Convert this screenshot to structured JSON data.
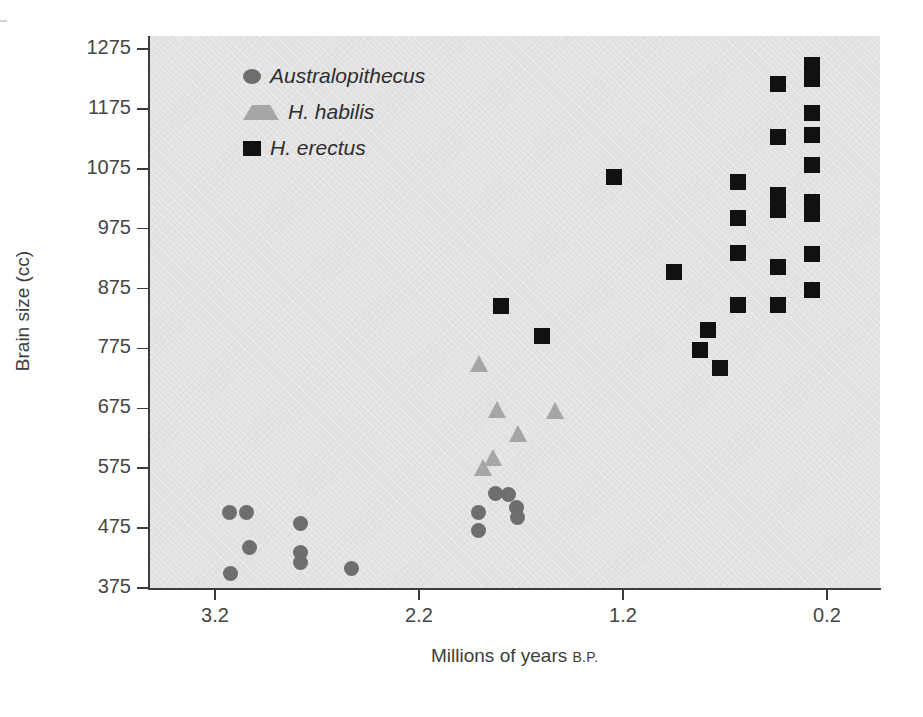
{
  "figure": {
    "background_color": "#ffffff",
    "plot_background_color": "#e2e2e2"
  },
  "axes": {
    "y_title": "Brain size (cc)",
    "x_title_main": "Millions of years ",
    "x_title_suffix": "B.P.",
    "y_ticks": [
      "375",
      "475",
      "575",
      "675",
      "775",
      "875",
      "975",
      "1075",
      "1175",
      "1275"
    ],
    "x_ticks": [
      "3.2",
      "2.2",
      "1.2",
      "0.2"
    ]
  },
  "legend": {
    "items": [
      {
        "label": "Australopithecus",
        "marker": "circle",
        "color": "#6e6e6e"
      },
      {
        "label": "H. habilis",
        "marker": "triangle",
        "color": "#a6a6a6"
      },
      {
        "label": "H. erectus",
        "marker": "square",
        "color": "#111111"
      }
    ]
  },
  "chart_data": {
    "type": "scatter",
    "title": "",
    "xlabel": "Millions of years B.P.",
    "ylabel": "Brain size (cc)",
    "xlim": [
      3.5,
      0.05
    ],
    "ylim": [
      375,
      1290
    ],
    "x_reversed": true,
    "grid": false,
    "legend_position": "upper-left-inside",
    "xticks": [
      3.2,
      2.2,
      1.2,
      0.2
    ],
    "yticks": [
      375,
      475,
      575,
      675,
      775,
      875,
      975,
      1075,
      1175,
      1275
    ],
    "series": [
      {
        "name": "Australopithecus",
        "marker": "circle",
        "color": "#6e6e6e",
        "points": [
          {
            "x": 3.13,
            "y": 498
          },
          {
            "x": 3.05,
            "y": 498
          },
          {
            "x": 3.04,
            "y": 440
          },
          {
            "x": 3.12,
            "y": 400
          },
          {
            "x": 2.79,
            "y": 483
          },
          {
            "x": 2.79,
            "y": 435
          },
          {
            "x": 2.79,
            "y": 418
          },
          {
            "x": 2.54,
            "y": 403
          },
          {
            "x": 1.75,
            "y": 472
          },
          {
            "x": 1.69,
            "y": 503
          },
          {
            "x": 1.63,
            "y": 502
          },
          {
            "x": 1.59,
            "y": 513
          },
          {
            "x": 1.58,
            "y": 496
          },
          {
            "x": 1.75,
            "y": 503
          }
        ]
      },
      {
        "name": "H. habilis",
        "marker": "triangle",
        "color": "#a6a6a6",
        "points": [
          {
            "x": 1.73,
            "y": 750
          },
          {
            "x": 1.64,
            "y": 672
          },
          {
            "x": 1.36,
            "y": 670
          },
          {
            "x": 1.55,
            "y": 631
          },
          {
            "x": 1.64,
            "y": 591
          },
          {
            "x": 1.7,
            "y": 580
          }
        ]
      },
      {
        "name": "H. erectus",
        "marker": "square",
        "color": "#111111",
        "points": [
          {
            "x": 1.62,
            "y": 847
          },
          {
            "x": 1.42,
            "y": 797
          },
          {
            "x": 1.18,
            "y": 1065
          },
          {
            "x": 0.57,
            "y": 902
          },
          {
            "x": 0.87,
            "y": 903
          },
          {
            "x": 0.83,
            "y": 812
          },
          {
            "x": 0.8,
            "y": 780
          },
          {
            "x": 0.7,
            "y": 750
          },
          {
            "x": 0.49,
            "y": 1057
          },
          {
            "x": 0.49,
            "y": 1022
          },
          {
            "x": 0.49,
            "y": 940
          },
          {
            "x": 0.49,
            "y": 848
          },
          {
            "x": 0.49,
            "y": 848
          },
          {
            "x": 0.49,
            "y": 1218
          },
          {
            "x": 0.49,
            "y": 1137
          },
          {
            "x": 0.32,
            "y": 1250
          },
          {
            "x": 0.32,
            "y": 1226
          },
          {
            "x": 0.32,
            "y": 1168
          },
          {
            "x": 0.32,
            "y": 1132
          },
          {
            "x": 0.32,
            "y": 1082
          },
          {
            "x": 0.32,
            "y": 1020
          },
          {
            "x": 0.32,
            "y": 1002
          },
          {
            "x": 0.32,
            "y": 873
          },
          {
            "x": 0.49,
            "y": 1012
          }
        ]
      }
    ]
  },
  "pixel_geometry": {
    "plot_left": 149,
    "plot_top": 36,
    "plot_width": 731,
    "plot_height": 552,
    "x_pix": {
      "3.2": 215,
      "2.2": 419,
      "1.2": 623,
      "0.2": 827
    },
    "y_pix": {
      "375": 588,
      "1275": 49
    }
  },
  "points_px": {
    "circles": [
      [
        229,
        512
      ],
      [
        246,
        512
      ],
      [
        249,
        547
      ],
      [
        230,
        573
      ],
      [
        300,
        523
      ],
      [
        300,
        552
      ],
      [
        300,
        562
      ],
      [
        351,
        568
      ],
      [
        478,
        530
      ],
      [
        495,
        493
      ],
      [
        508,
        494
      ],
      [
        516,
        507
      ],
      [
        517,
        517
      ],
      [
        478,
        512
      ]
    ],
    "triangles": [
      [
        479,
        364
      ],
      [
        497,
        410
      ],
      [
        555,
        411
      ],
      [
        518,
        434
      ],
      [
        493,
        458
      ],
      [
        483,
        468
      ]
    ],
    "squares": [
      [
        501,
        306
      ],
      [
        542,
        336
      ],
      [
        614,
        177
      ],
      [
        738,
        182
      ],
      [
        738,
        218
      ],
      [
        738,
        253
      ],
      [
        674,
        272
      ],
      [
        738,
        305
      ],
      [
        708,
        330
      ],
      [
        700,
        350
      ],
      [
        720,
        368
      ],
      [
        778,
        84
      ],
      [
        778,
        137
      ],
      [
        778,
        195
      ],
      [
        778,
        210
      ],
      [
        778,
        267
      ],
      [
        778,
        305
      ],
      [
        812,
        65
      ],
      [
        812,
        79
      ],
      [
        812,
        113
      ],
      [
        812,
        135
      ],
      [
        812,
        165
      ],
      [
        812,
        202
      ],
      [
        812,
        214
      ],
      [
        812,
        254
      ],
      [
        812,
        290
      ]
    ]
  }
}
